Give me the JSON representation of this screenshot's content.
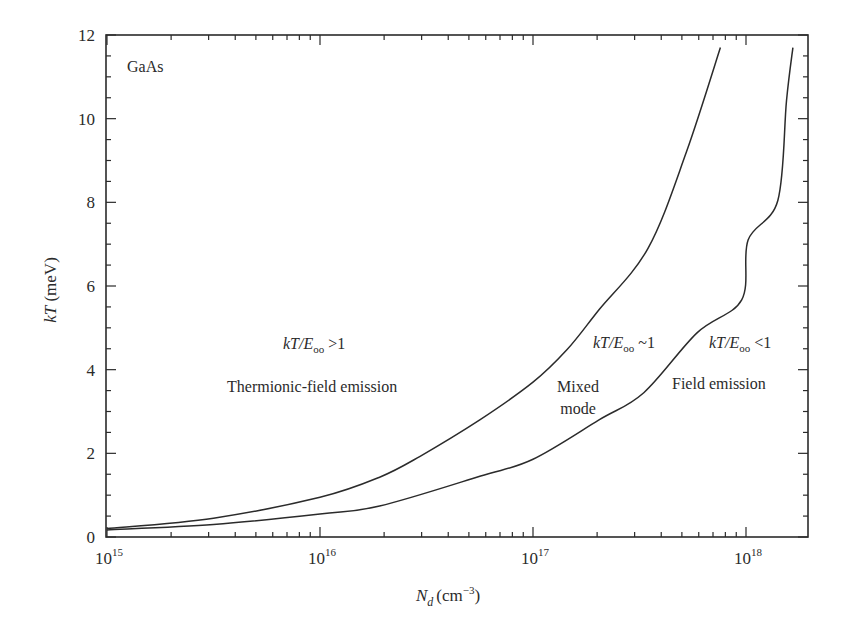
{
  "chart_data": {
    "type": "line",
    "title": "",
    "xlabel": "N_d (cm^-3)",
    "xlabel_main": "N",
    "xlabel_sub": "d",
    "xlabel_unit": "(cm",
    "xlabel_unit_exp": "−3",
    "xlabel_unit_close": ")",
    "ylabel": "kT (meV)",
    "ylabel_italic": "kT",
    "ylabel_unit": " (meV)",
    "xscale": "log",
    "xlim_log10": [
      15,
      18.3
    ],
    "ylim": [
      0,
      12
    ],
    "x_ticks": [
      {
        "base": "10",
        "exp": "15",
        "log10": 15
      },
      {
        "base": "10",
        "exp": "16",
        "log10": 16
      },
      {
        "base": "10",
        "exp": "17",
        "log10": 17
      },
      {
        "base": "10",
        "exp": "18",
        "log10": 18
      }
    ],
    "y_ticks": [
      "0",
      "2",
      "4",
      "6",
      "8",
      "10",
      "12"
    ],
    "y_tick_values": [
      0,
      2,
      4,
      6,
      8,
      10,
      12
    ],
    "y_minor_step": 0.5,
    "grid": false,
    "series": [
      {
        "name": "kT/E00 ~ 1 boundary (upper)",
        "log10_x": [
          15.0,
          15.5,
          16.0,
          16.28,
          16.47,
          16.75,
          17.0,
          17.16,
          17.31,
          17.54,
          17.72,
          17.88
        ],
        "y": [
          0.2,
          0.45,
          0.95,
          1.43,
          1.93,
          2.8,
          3.7,
          4.48,
          5.43,
          6.9,
          9.2,
          11.7
        ]
      },
      {
        "name": "kT/E00 < 1 boundary (lower)",
        "log10_x": [
          15.0,
          15.5,
          16.0,
          16.28,
          16.75,
          17.0,
          17.31,
          17.52,
          17.77,
          17.98,
          18.01,
          18.15,
          18.19,
          18.22
        ],
        "y": [
          0.17,
          0.3,
          0.55,
          0.74,
          1.45,
          1.86,
          2.8,
          3.45,
          4.88,
          5.67,
          7.1,
          8.05,
          10.43,
          11.7
        ]
      }
    ],
    "annotations": [
      {
        "id": "material",
        "text": "GaAs"
      },
      {
        "id": "tfe-ratio",
        "prefix": "kT/E",
        "sub": "oo",
        "suffix": " >1"
      },
      {
        "id": "tfe-label",
        "text": "Thermionic-field emission"
      },
      {
        "id": "mixed-ratio",
        "prefix": "kT/E",
        "sub": "oo",
        "suffix": " ~1"
      },
      {
        "id": "mixed-label-1",
        "text": "Mixed"
      },
      {
        "id": "mixed-label-2",
        "text": "mode"
      },
      {
        "id": "fe-ratio",
        "prefix": "kT/E",
        "sub": "oo",
        "suffix": " <1"
      },
      {
        "id": "fe-label",
        "text": "Field emission"
      }
    ]
  },
  "colors": {
    "line": "#2b2b2b",
    "axis": "#2b2b2b",
    "background": "#ffffff"
  }
}
